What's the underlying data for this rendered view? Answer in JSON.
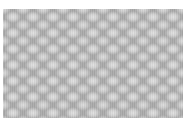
{
  "image": {
    "subject": "grayscale knit fabric texture",
    "colors": {
      "background": "#ffffff",
      "highlight": "#e0e0e0",
      "midtone": "#c8c8c8",
      "shadow": "#a9a9a9"
    }
  }
}
